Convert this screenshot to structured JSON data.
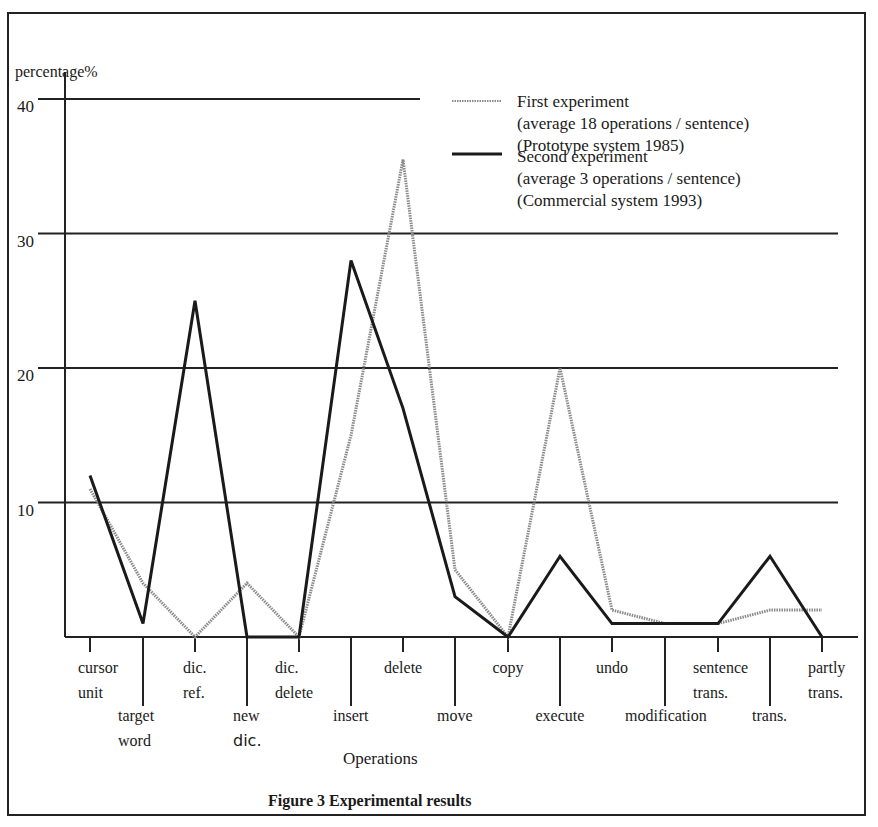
{
  "figure": {
    "caption": "Figure 3  Experimental results",
    "y_axis_title": "percentage%",
    "x_axis_title": "Operations"
  },
  "legend": {
    "first": {
      "line1": "First experiment",
      "line2": "(average 18 operations / sentence)",
      "line3": "(Prototype   system 1985)"
    },
    "second": {
      "line1": "Second experiment",
      "line2": " (average 3 operations / sentence)",
      "line3": "(Commercial system 1993)"
    }
  },
  "y_ticks": [
    "40",
    "30",
    "20",
    "10"
  ],
  "x_labels": [
    {
      "l1": "cursor",
      "l2": "unit"
    },
    {
      "l1": "target",
      "l2": "word"
    },
    {
      "l1": "dic.",
      "l2": "ref."
    },
    {
      "l1": "new",
      "l2": "dic."
    },
    {
      "l1": "dic.",
      "l2": "delete"
    },
    {
      "l1": "insert",
      "l2": ""
    },
    {
      "l1": "delete",
      "l2": ""
    },
    {
      "l1": "move",
      "l2": ""
    },
    {
      "l1": "copy",
      "l2": ""
    },
    {
      "l1": "execute",
      "l2": ""
    },
    {
      "l1": "undo",
      "l2": ""
    },
    {
      "l1": "modification",
      "l2": ""
    },
    {
      "l1": "sentence",
      "l2": "trans."
    },
    {
      "l1": "trans.",
      "l2": ""
    },
    {
      "l1": "partly",
      "l2": "trans."
    }
  ],
  "chart_data": {
    "type": "line",
    "title": "Figure 3  Experimental results",
    "xlabel": "Operations",
    "ylabel": "percentage%",
    "ylim": [
      0,
      40
    ],
    "yticks": [
      10,
      20,
      30,
      40
    ],
    "grid": true,
    "legend_position": "top-right",
    "categories": [
      "cursor unit",
      "target word",
      "dic. ref.",
      "new dic.",
      "dic. delete",
      "insert",
      "delete",
      "move",
      "copy",
      "execute",
      "undo",
      "modification",
      "sentence trans.",
      "trans.",
      "partly trans."
    ],
    "series": [
      {
        "name": "First experiment (average 18 operations / sentence) (Prototype system 1985)",
        "style": "dotted",
        "values": [
          11,
          4,
          0,
          4,
          0,
          15,
          35.5,
          5,
          0,
          20,
          2,
          1,
          1,
          2,
          2
        ]
      },
      {
        "name": "Second experiment (average 3 operations / sentence) (Commercial system 1993)",
        "style": "solid",
        "values": [
          12,
          1,
          25,
          0,
          0,
          28,
          17,
          3,
          0,
          6,
          1,
          1,
          1,
          6,
          0
        ]
      }
    ]
  }
}
